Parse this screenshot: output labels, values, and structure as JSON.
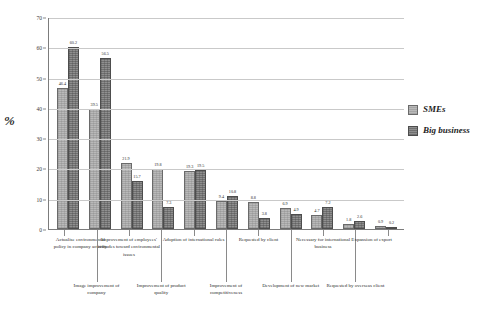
{
  "chart_data": {
    "type": "bar",
    "title": "",
    "subtitle": "",
    "xlabel": "",
    "ylabel": "%",
    "ylim": [
      0,
      70
    ],
    "yticks": [
      0,
      10,
      20,
      30,
      40,
      50,
      60,
      70
    ],
    "grid": true,
    "legend_position": "right",
    "categories": [
      "Actualise environmental policy in company activity",
      "Image improvement of company",
      "Improvement of employees' attitudes toward environmental issues",
      "Improvement of product quality",
      "Adoption of international rules",
      "Improvement of competitiveness",
      "Requested by client",
      "Development of new market",
      "Necessary for international business",
      "Requested by overseas client",
      "Expansion of export"
    ],
    "series": [
      {
        "name": "SMEs",
        "color": "#b9b9b9",
        "values": [
          46.4,
          39.5,
          21.9,
          19.8,
          19.3,
          9.4,
          8.8,
          6.9,
          4.7,
          1.8,
          0.9
        ]
      },
      {
        "name": "Big business",
        "color": "#8f8f8f",
        "values": [
          60.2,
          56.5,
          15.7,
          7.3,
          19.5,
          10.8,
          3.8,
          4.9,
          7.2,
          2.6,
          0.2
        ]
      }
    ],
    "value_labels": [
      [
        "46.4",
        "60.2"
      ],
      [
        "39.5",
        "56.5"
      ],
      [
        "21.9",
        "15.7"
      ],
      [
        "19.8",
        "7.3"
      ],
      [
        "19.3",
        "19.5"
      ],
      [
        "9.4",
        "10.8"
      ],
      [
        "8.8",
        "3.8"
      ],
      [
        "6.9",
        "4.9"
      ],
      [
        "4.7",
        "7.2"
      ],
      [
        "1.8",
        "2.6"
      ],
      [
        "0.9",
        "0.2"
      ]
    ]
  },
  "legend": {
    "entries": [
      {
        "label": "SMEs"
      },
      {
        "label": "Big business"
      }
    ]
  },
  "axis": {
    "y_title": "%",
    "y_tick_labels": [
      "70",
      "60",
      "50",
      "40",
      "30",
      "20",
      "10",
      "0"
    ]
  },
  "category_labels_top": [
    "Actualise environmental policy in company activity",
    "Improvement of employees' attitudes toward environmental issues",
    "Adoption of international rules",
    "Requested by client",
    "Necessary for international business",
    "Expansion of export"
  ],
  "category_labels_bottom": [
    "Image improvement of company",
    "Improvement of product quality",
    "Improvement of competitiveness",
    "Development of new market",
    "Requested by overseas client"
  ]
}
